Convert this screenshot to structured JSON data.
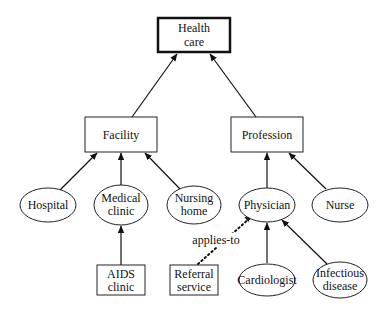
{
  "diagram": {
    "type": "concept-hierarchy",
    "nodes": {
      "health_care": {
        "lines": [
          "Health",
          "care"
        ],
        "shape": "box-bold"
      },
      "facility": {
        "lines": [
          "Facility"
        ],
        "shape": "box"
      },
      "profession": {
        "lines": [
          "Profession"
        ],
        "shape": "box"
      },
      "hospital": {
        "lines": [
          "Hospital"
        ],
        "shape": "ellipse"
      },
      "medical_clinic": {
        "lines": [
          "Medical",
          "clinic"
        ],
        "shape": "ellipse"
      },
      "nursing_home": {
        "lines": [
          "Nursing",
          "home"
        ],
        "shape": "ellipse"
      },
      "physician": {
        "lines": [
          "Physician"
        ],
        "shape": "ellipse"
      },
      "nurse": {
        "lines": [
          "Nurse"
        ],
        "shape": "ellipse"
      },
      "aids_clinic": {
        "lines": [
          "AIDS",
          "clinic"
        ],
        "shape": "box"
      },
      "referral_service": {
        "lines": [
          "Referral",
          "service"
        ],
        "shape": "box"
      },
      "cardiologist": {
        "lines": [
          "Cardiologist"
        ],
        "shape": "ellipse"
      },
      "infectious_disease": {
        "lines": [
          "Infectious",
          "disease"
        ],
        "shape": "ellipse"
      }
    },
    "edges": [
      {
        "from": "facility",
        "to": "health_care",
        "style": "solid"
      },
      {
        "from": "profession",
        "to": "health_care",
        "style": "solid"
      },
      {
        "from": "hospital",
        "to": "facility",
        "style": "solid"
      },
      {
        "from": "medical_clinic",
        "to": "facility",
        "style": "solid"
      },
      {
        "from": "nursing_home",
        "to": "facility",
        "style": "solid"
      },
      {
        "from": "physician",
        "to": "profession",
        "style": "solid"
      },
      {
        "from": "nurse",
        "to": "profession",
        "style": "solid"
      },
      {
        "from": "aids_clinic",
        "to": "medical_clinic",
        "style": "solid"
      },
      {
        "from": "referral_service",
        "to": "physician",
        "style": "dotted",
        "label": "applies-to"
      },
      {
        "from": "cardiologist",
        "to": "physician",
        "style": "solid"
      },
      {
        "from": "infectious_disease",
        "to": "physician",
        "style": "solid"
      }
    ],
    "edge_labels": {
      "applies_to": "applies-to"
    }
  }
}
